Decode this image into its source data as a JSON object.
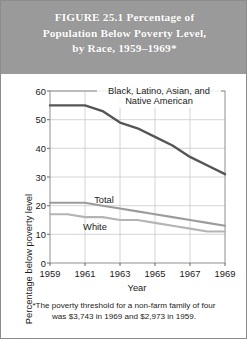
{
  "figure": {
    "title": "FIGURE 25.1   Percentage of\nPopulation Below Poverty Level,\nby Race, 1959–1969*",
    "title_band_color": "#9a9a9a",
    "title_text_color": "#ffffff",
    "footnote_line1": "*The poverty threshold for a non-farm family of four",
    "footnote_line2": "was  $3,743 in 1969 and $2,973 in 1959."
  },
  "chart_data": {
    "type": "line",
    "title": "FIGURE 25.1   Percentage of Population Below Poverty Level, by Race, 1959–1969*",
    "xlabel": "Year",
    "ylabel": "Percentage below poverty level",
    "x": [
      1959,
      1960,
      1961,
      1962,
      1963,
      1964,
      1965,
      1966,
      1967,
      1968,
      1969
    ],
    "xlim": [
      1959,
      1969
    ],
    "ylim": [
      0,
      60
    ],
    "xticks": [
      1959,
      1961,
      1963,
      1965,
      1967,
      1969
    ],
    "yticks": [
      0,
      10,
      20,
      30,
      40,
      50,
      60
    ],
    "xtick_labels": [
      "1959",
      "1961",
      "1963",
      "1965",
      "1967",
      "1969"
    ],
    "ytick_labels": [
      "0",
      "10",
      "20",
      "30",
      "40",
      "50",
      "60"
    ],
    "grid": true,
    "legend": "inline-labels",
    "series": [
      {
        "name": "Black, Latino, Asian, and Native American",
        "label_line1": "Black, Latino, Asian, and",
        "label_line2": "Native American",
        "color": "#555555",
        "values": [
          55,
          55,
          55,
          53,
          49,
          47,
          44,
          41,
          37,
          34,
          31
        ]
      },
      {
        "name": "Total",
        "label_line1": "Total",
        "label_line2": "",
        "color": "#9b9b9b",
        "values": [
          21,
          21,
          21,
          20,
          19,
          18,
          17,
          16,
          15,
          14,
          13
        ]
      },
      {
        "name": "White",
        "label_line1": "White",
        "label_line2": "",
        "color": "#b4b4b4",
        "values": [
          17,
          17,
          16,
          16,
          15,
          15,
          14,
          13,
          12,
          11,
          11
        ]
      }
    ]
  }
}
